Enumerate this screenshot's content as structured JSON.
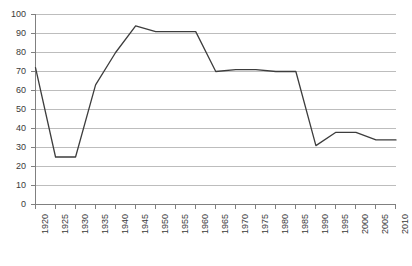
{
  "chart_data": {
    "type": "line",
    "title": "",
    "subtitle": "",
    "xlabel": "",
    "ylabel": "",
    "x": [
      1920,
      1925,
      1930,
      1935,
      1940,
      1945,
      1950,
      1955,
      1960,
      1965,
      1970,
      1975,
      1980,
      1985,
      1990,
      1995,
      2000,
      2005,
      2010
    ],
    "categories": [
      "1920",
      "1925",
      "1930",
      "1935",
      "1940",
      "1945",
      "1950",
      "1955",
      "1960",
      "1965",
      "1970",
      "1975",
      "1980",
      "1985",
      "1990",
      "1995",
      "2000",
      "2005",
      "2010"
    ],
    "values": [
      72,
      25,
      25,
      63,
      80,
      94,
      91,
      91,
      91,
      70,
      71,
      71,
      70,
      70,
      31,
      38,
      38,
      34,
      34
    ],
    "series": [
      {
        "name": "",
        "values": [
          72,
          25,
          25,
          63,
          80,
          94,
          91,
          91,
          91,
          70,
          71,
          71,
          70,
          70,
          31,
          38,
          38,
          34,
          34
        ],
        "color": "#3d3d3d"
      }
    ],
    "ylim": [
      0,
      100
    ],
    "xlim": [
      1920,
      2010
    ],
    "y_ticks": [
      0,
      10,
      20,
      30,
      40,
      50,
      60,
      70,
      80,
      90,
      100
    ],
    "y_tick_labels": [
      "0",
      "10",
      "20",
      "30",
      "40",
      "50",
      "60",
      "70",
      "80",
      "90",
      "100"
    ],
    "x_tick_labels": [
      "1920",
      "1925",
      "1930",
      "1935",
      "1940",
      "1945",
      "1950",
      "1955",
      "1960",
      "1965",
      "1970",
      "1975",
      "1980",
      "1985",
      "1990",
      "1995",
      "2000",
      "2005",
      "2010"
    ],
    "grid": "horizontal",
    "grid_color": "#bdbdbd",
    "axis_color": "#808080",
    "legend": "none",
    "legend_position": "none",
    "annotations": []
  }
}
